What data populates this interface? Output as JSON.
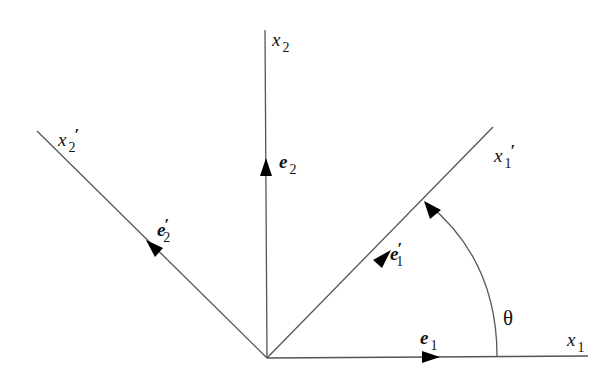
{
  "diagram": {
    "type": "coordinate-rotation",
    "colors": {
      "line": "#555555",
      "text": "#111111",
      "background": "#ffffff"
    },
    "origin": [
      267,
      358
    ],
    "axes": [
      {
        "id": "x1",
        "label": "x",
        "subscript": "1",
        "prime": "",
        "end": [
          588,
          356
        ]
      },
      {
        "id": "x2",
        "label": "x",
        "subscript": "2",
        "prime": "",
        "end": [
          265,
          30
        ]
      },
      {
        "id": "x1p",
        "label": "x",
        "subscript": "1",
        "prime": "′",
        "end": [
          493,
          127
        ]
      },
      {
        "id": "x2p",
        "label": "x",
        "subscript": "2",
        "prime": "′",
        "end": [
          37,
          131
        ]
      }
    ],
    "basis_vectors": [
      {
        "id": "e1",
        "label": "e",
        "subscript": "1",
        "prime": ""
      },
      {
        "id": "e2",
        "label": "e",
        "subscript": "2",
        "prime": ""
      },
      {
        "id": "e1p",
        "label": "e",
        "subscript": "1",
        "prime": "′"
      },
      {
        "id": "e2p",
        "label": "e",
        "subscript": "2",
        "prime": "′"
      }
    ],
    "angle": {
      "label": "θ",
      "from_axis": "x1",
      "to_axis": "x1p"
    }
  }
}
